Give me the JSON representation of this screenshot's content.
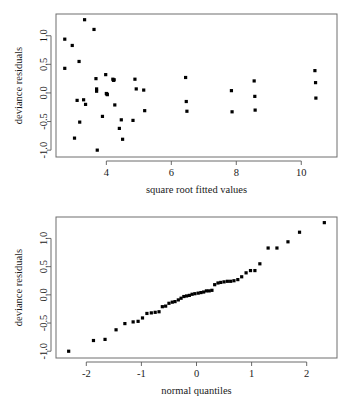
{
  "page": {
    "background_color": "#ffffff",
    "point_color": "#000000",
    "axis_color": "#5a5a5a",
    "border_color": "#6e6e6e"
  },
  "chart_data": [
    {
      "id": "residuals-vs-fitted",
      "type": "scatter",
      "title": "",
      "xlabel": "square root fitted values",
      "ylabel": "deviance residuals",
      "xlim": [
        2.45,
        11.1
      ],
      "ylim": [
        -1.12,
        1.38
      ],
      "xticks": [
        4,
        6,
        8,
        10
      ],
      "xticklabels": [
        "4",
        "6",
        "8",
        "10"
      ],
      "yticks": [
        1.0,
        0.5,
        0.0,
        -0.5,
        -1.0
      ],
      "yticklabels": [
        "1.0",
        "0.5",
        "0.0",
        "-0.5",
        "-1.0"
      ],
      "grid": false,
      "legend": null,
      "points": [
        [
          2.72,
          0.94
        ],
        [
          2.72,
          0.43
        ],
        [
          2.95,
          0.83
        ],
        [
          3.02,
          -0.79
        ],
        [
          3.1,
          -0.13
        ],
        [
          3.16,
          0.55
        ],
        [
          3.18,
          -0.51
        ],
        [
          3.3,
          -0.12
        ],
        [
          3.33,
          1.28
        ],
        [
          3.36,
          -0.2
        ],
        [
          3.62,
          1.11
        ],
        [
          3.68,
          0.25
        ],
        [
          3.7,
          0.07
        ],
        [
          3.7,
          0.03
        ],
        [
          3.72,
          -1.0
        ],
        [
          3.88,
          -0.41
        ],
        [
          3.98,
          0.32
        ],
        [
          4.0,
          -0.01
        ],
        [
          4.02,
          -0.02
        ],
        [
          4.03,
          -0.03
        ],
        [
          4.2,
          0.24
        ],
        [
          4.22,
          0.22
        ],
        [
          4.24,
          0.23
        ],
        [
          4.26,
          -0.21
        ],
        [
          4.4,
          -0.62
        ],
        [
          4.46,
          -0.47
        ],
        [
          4.5,
          -0.81
        ],
        [
          4.82,
          -0.48
        ],
        [
          4.88,
          0.24
        ],
        [
          4.92,
          0.07
        ],
        [
          5.15,
          0.05
        ],
        [
          5.18,
          -0.31
        ],
        [
          6.44,
          0.27
        ],
        [
          6.46,
          -0.15
        ],
        [
          6.48,
          -0.32
        ],
        [
          7.85,
          0.04
        ],
        [
          7.87,
          -0.33
        ],
        [
          8.55,
          0.21
        ],
        [
          8.57,
          -0.06
        ],
        [
          8.58,
          -0.3
        ],
        [
          10.42,
          0.39
        ],
        [
          10.44,
          0.18
        ],
        [
          10.45,
          -0.09
        ]
      ]
    },
    {
      "id": "normal-qq-plot",
      "type": "scatter",
      "title": "",
      "xlabel": "normal quantiles",
      "ylabel": "deviance residuals",
      "xlim": [
        -2.55,
        2.55
      ],
      "ylim": [
        -1.12,
        1.38
      ],
      "xticks": [
        -2,
        -1,
        0,
        1,
        2
      ],
      "xticklabels": [
        "-2",
        "-1",
        "0",
        "1",
        "2"
      ],
      "yticks": [
        1.0,
        0.5,
        0.0,
        -0.5,
        -1.0
      ],
      "yticklabels": [
        "1.0",
        "0.5",
        "0.0",
        "-0.5",
        "-1.0"
      ],
      "grid": false,
      "legend": null,
      "points": [
        [
          -2.32,
          -1.0
        ],
        [
          -1.87,
          -0.81
        ],
        [
          -1.66,
          -0.79
        ],
        [
          -1.46,
          -0.62
        ],
        [
          -1.3,
          -0.51
        ],
        [
          -1.15,
          -0.48
        ],
        [
          -1.06,
          -0.47
        ],
        [
          -0.98,
          -0.41
        ],
        [
          -0.9,
          -0.33
        ],
        [
          -0.82,
          -0.32
        ],
        [
          -0.75,
          -0.31
        ],
        [
          -0.68,
          -0.3
        ],
        [
          -0.62,
          -0.21
        ],
        [
          -0.56,
          -0.2
        ],
        [
          -0.5,
          -0.15
        ],
        [
          -0.44,
          -0.13
        ],
        [
          -0.39,
          -0.12
        ],
        [
          -0.33,
          -0.09
        ],
        [
          -0.28,
          -0.06
        ],
        [
          -0.23,
          -0.03
        ],
        [
          -0.18,
          -0.02
        ],
        [
          -0.13,
          -0.01
        ],
        [
          -0.08,
          0.01
        ],
        [
          -0.03,
          0.02
        ],
        [
          0.03,
          0.03
        ],
        [
          0.08,
          0.04
        ],
        [
          0.13,
          0.05
        ],
        [
          0.18,
          0.07
        ],
        [
          0.23,
          0.07
        ],
        [
          0.28,
          0.08
        ],
        [
          0.33,
          0.18
        ],
        [
          0.39,
          0.21
        ],
        [
          0.44,
          0.22
        ],
        [
          0.5,
          0.23
        ],
        [
          0.56,
          0.24
        ],
        [
          0.62,
          0.24
        ],
        [
          0.68,
          0.25
        ],
        [
          0.75,
          0.27
        ],
        [
          0.82,
          0.32
        ],
        [
          0.9,
          0.39
        ],
        [
          0.98,
          0.43
        ],
        [
          1.06,
          0.43
        ],
        [
          1.15,
          0.55
        ],
        [
          1.3,
          0.83
        ],
        [
          1.46,
          0.83
        ],
        [
          1.66,
          0.94
        ],
        [
          1.87,
          1.11
        ],
        [
          2.32,
          1.28
        ]
      ]
    }
  ]
}
